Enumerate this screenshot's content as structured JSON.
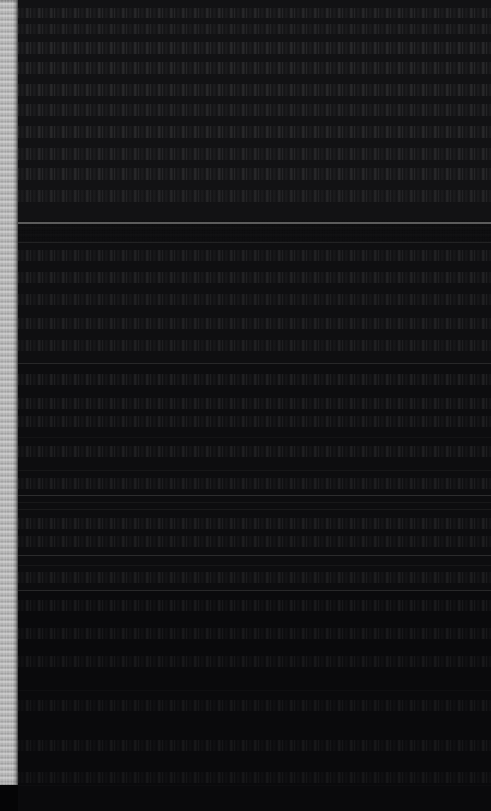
{
  "image": {
    "width": 491,
    "height": 811,
    "description": "Near-black, heavily underexposed screenshot. No text or icon glyphs are legible at any magnification.",
    "background_color": "#0a0a0c"
  },
  "scrollbar": {
    "name": "vertical-scrollbar",
    "orientation": "vertical",
    "x": 0,
    "width": 18,
    "track_color": "#050506",
    "track_top": 0,
    "track_height": 811,
    "thumb_color": "#e8e8e8",
    "thumb_top": 0,
    "thumb_height": 785
  },
  "content": {
    "name": "content-pane",
    "x": 18,
    "width": 473,
    "height": 811,
    "background_color": "#0a0a0c",
    "blocks": [
      {
        "label": "upper-block",
        "top": 0,
        "height": 220,
        "shade": "#121214"
      },
      {
        "label": "middle-block",
        "top": 243,
        "height": 120,
        "shade": "#0f0f11"
      },
      {
        "label": "list-block",
        "top": 364,
        "height": 226,
        "shade": "#0d0d0f"
      },
      {
        "label": "lower-block",
        "top": 591,
        "height": 220,
        "shade": "#0a0a0c"
      }
    ],
    "dividers": [
      {
        "y": 222,
        "color": "#6a6a6a",
        "weight": "strong"
      },
      {
        "y": 242,
        "color": "#3a3a3a",
        "weight": "medium"
      },
      {
        "y": 363,
        "color": "#4a4a4a",
        "weight": "medium"
      },
      {
        "y": 437,
        "color": "#2e2e2e",
        "weight": "faint"
      },
      {
        "y": 470,
        "color": "#3a3a3a",
        "weight": "faint"
      },
      {
        "y": 495,
        "color": "#555555",
        "weight": "medium"
      },
      {
        "y": 502,
        "color": "#3f3f3f",
        "weight": "faint"
      },
      {
        "y": 509,
        "color": "#4a4a4a",
        "weight": "faint"
      },
      {
        "y": 555,
        "color": "#4f4f4f",
        "weight": "medium"
      },
      {
        "y": 565,
        "color": "#3a3a3a",
        "weight": "faint"
      },
      {
        "y": 590,
        "color": "#4a4a4a",
        "weight": "medium"
      },
      {
        "y": 690,
        "color": "#262626",
        "weight": "faint"
      },
      {
        "y": 785,
        "color": "#222222",
        "weight": "faint"
      }
    ],
    "text_rows": [
      {
        "top": 8,
        "height": 10,
        "density": 0.55
      },
      {
        "top": 24,
        "height": 10,
        "density": 0.48
      },
      {
        "top": 42,
        "height": 12,
        "density": 0.62
      },
      {
        "top": 62,
        "height": 12,
        "density": 0.58
      },
      {
        "top": 84,
        "height": 12,
        "density": 0.6
      },
      {
        "top": 104,
        "height": 12,
        "density": 0.52
      },
      {
        "top": 126,
        "height": 12,
        "density": 0.58
      },
      {
        "top": 148,
        "height": 12,
        "density": 0.5
      },
      {
        "top": 168,
        "height": 12,
        "density": 0.54
      },
      {
        "top": 190,
        "height": 12,
        "density": 0.46
      },
      {
        "top": 250,
        "height": 11,
        "density": 0.4
      },
      {
        "top": 272,
        "height": 11,
        "density": 0.44
      },
      {
        "top": 294,
        "height": 11,
        "density": 0.38
      },
      {
        "top": 318,
        "height": 11,
        "density": 0.42
      },
      {
        "top": 340,
        "height": 11,
        "density": 0.36
      },
      {
        "top": 374,
        "height": 11,
        "density": 0.44
      },
      {
        "top": 398,
        "height": 11,
        "density": 0.4
      },
      {
        "top": 416,
        "height": 11,
        "density": 0.38
      },
      {
        "top": 446,
        "height": 11,
        "density": 0.42
      },
      {
        "top": 478,
        "height": 11,
        "density": 0.36
      },
      {
        "top": 518,
        "height": 11,
        "density": 0.4
      },
      {
        "top": 536,
        "height": 11,
        "density": 0.34
      },
      {
        "top": 572,
        "height": 11,
        "density": 0.32
      },
      {
        "top": 600,
        "height": 11,
        "density": 0.28
      },
      {
        "top": 628,
        "height": 11,
        "density": 0.24
      },
      {
        "top": 656,
        "height": 11,
        "density": 0.22
      },
      {
        "top": 700,
        "height": 11,
        "density": 0.18
      },
      {
        "top": 740,
        "height": 11,
        "density": 0.16
      },
      {
        "top": 772,
        "height": 11,
        "density": 0.14
      }
    ]
  }
}
